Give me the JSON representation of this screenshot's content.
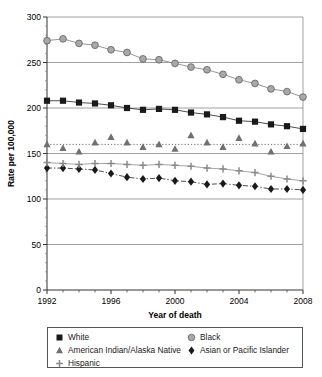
{
  "chart_data": {
    "type": "line",
    "title": "",
    "xlabel": "Year of death",
    "ylabel": "Rate per 100,000",
    "xlim": [
      1992,
      2008
    ],
    "ylim": [
      0,
      300
    ],
    "ytick_values": [
      0,
      50,
      100,
      150,
      200,
      250,
      300
    ],
    "ytick_labels": [
      "0",
      "50",
      "100",
      "150",
      "200",
      "250",
      "300"
    ],
    "xtick_values": [
      1992,
      1993,
      1994,
      1995,
      1996,
      1997,
      1998,
      1999,
      2000,
      2001,
      2002,
      2003,
      2004,
      2005,
      2006,
      2007,
      2008
    ],
    "xtick_labels_shown": [
      "1992",
      "1996",
      "2000",
      "2004",
      "2008"
    ],
    "xtick_labels_shown_values": [
      1992,
      1996,
      2000,
      2004,
      2008
    ],
    "grid": "horizontal",
    "legend_position": "below-axes",
    "x": [
      1992,
      1993,
      1994,
      1995,
      1996,
      1997,
      1998,
      1999,
      2000,
      2001,
      2002,
      2003,
      2004,
      2005,
      2006,
      2007,
      2008
    ],
    "series": [
      {
        "name": "White",
        "marker": "square",
        "color": "#1a1a1a",
        "line_color": "#3a3a3a",
        "line_style": "solid",
        "values": [
          208,
          208,
          206,
          205,
          203,
          200,
          198,
          199,
          198,
          195,
          193,
          190,
          186,
          185,
          182,
          180,
          177
        ]
      },
      {
        "name": "Black",
        "marker": "circle",
        "color": "#a8a8a8",
        "line_color": "#8c8c8c",
        "line_style": "solid",
        "values": [
          274,
          276,
          271,
          269,
          264,
          261,
          254,
          253,
          249,
          245,
          242,
          237,
          231,
          227,
          221,
          218,
          212
        ]
      },
      {
        "name": "American Indian/Alaska Native",
        "marker": "triangle",
        "color": "#707070",
        "line_color": "#6e6e6e",
        "line_style": "dotted",
        "values": [
          160,
          156,
          152,
          162,
          168,
          162,
          157,
          160,
          155,
          170,
          162,
          157,
          167,
          161,
          152,
          158,
          161
        ]
      },
      {
        "name": "Asian or Pacific Islander",
        "marker": "diamond",
        "color": "#1a1a1a",
        "line_color": "#3a3a3a",
        "line_style": "dashdot",
        "values": [
          134,
          134,
          133,
          132,
          128,
          124,
          122,
          123,
          120,
          119,
          116,
          117,
          115,
          114,
          111,
          111,
          110
        ]
      },
      {
        "name": "Hispanic",
        "marker": "plus",
        "color": "#8a8a8a",
        "line_color": "#9a9a9a",
        "line_style": "solid",
        "values": [
          140,
          139,
          138,
          139,
          139,
          138,
          137,
          138,
          137,
          136,
          134,
          133,
          131,
          129,
          125,
          122,
          120
        ]
      }
    ]
  },
  "legend": {
    "column_left": [
      {
        "label": "White",
        "marker": "square"
      },
      {
        "label": "American Indian/Alaska Native",
        "marker": "triangle"
      },
      {
        "label": "Hispanic",
        "marker": "plus"
      }
    ],
    "column_right": [
      {
        "label": "Black",
        "marker": "circle"
      },
      {
        "label": "Asian or Pacific Islander",
        "marker": "diamond"
      }
    ]
  }
}
